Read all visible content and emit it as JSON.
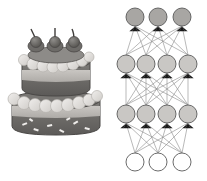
{
  "image": {
    "width": 207,
    "height": 181,
    "background": "#ffffff",
    "composition": "two-panel side-by-side illustration",
    "left_panel_name": "layered-birthday-cake",
    "right_panel_name": "feedforward-neural-network-diagram"
  },
  "cake": {
    "name": "two-tier layered cake",
    "style": "grayscale clip-art illustration",
    "tiers": 2,
    "topper_count": 3,
    "topper_name": "cherry-with-stem",
    "bounds": {
      "x": 12,
      "y": 32,
      "width": 88,
      "height": 103
    },
    "colors": {
      "frosting_light": "#e8e6e3",
      "frosting_mid": "#cfccc8",
      "cream_band": "#b9b6b2",
      "cake_dark": "#6f6d6a",
      "cake_mid": "#908d8a",
      "cake_shadow": "#585654",
      "outline": "#4a4846",
      "cherry_dark": "#5e5c5a",
      "cherry_mid": "#7e7c79",
      "stem": "#4a4846",
      "sprinkle": "#f2f0ee"
    },
    "top_tier": {
      "center_x": 56,
      "top_y": 52,
      "radius_x": 34,
      "height": 36,
      "bands": [
        "frosting-scallop",
        "dark-cake",
        "cream-stripe",
        "dark-cake"
      ]
    },
    "bottom_tier": {
      "center_x": 56,
      "top_y": 88,
      "radius_x": 44,
      "height": 47,
      "bands": [
        "frosting-scallop",
        "dark-cake",
        "cream-stripe",
        "dark-cake-with-sprinkles"
      ]
    },
    "toppers": [
      {
        "cx": 36,
        "cy": 44,
        "r": 7,
        "stem_tip_x": 31,
        "stem_tip_y": 30
      },
      {
        "cx": 55,
        "cy": 44,
        "r": 7,
        "stem_tip_x": 55,
        "stem_tip_y": 28
      },
      {
        "cx": 74,
        "cy": 44,
        "r": 7,
        "stem_tip_x": 72,
        "stem_tip_y": 30
      }
    ]
  },
  "network": {
    "name": "feedforward neural network",
    "layer_count": 4,
    "layer_sizes": [
      3,
      4,
      4,
      3
    ],
    "edge_color": "#8a8a8a",
    "node_outline": "#5a5a5a",
    "arrowheads": true,
    "arrow_color": "#1a1a1a",
    "flow_direction": "bottom-to-top",
    "layers": [
      {
        "index": 0,
        "role": "output-layer",
        "node_count": 3,
        "y": 17,
        "radius": 9,
        "fill": "#a8a6a3",
        "xs": [
          135,
          158,
          182
        ],
        "has_incoming_arrows": true
      },
      {
        "index": 1,
        "role": "hidden-layer-2",
        "node_count": 4,
        "y": 64,
        "radius": 9,
        "fill": "#c9c7c4",
        "xs": [
          126,
          146,
          167,
          188
        ],
        "has_incoming_arrows": true
      },
      {
        "index": 2,
        "role": "hidden-layer-1",
        "node_count": 4,
        "y": 114,
        "radius": 9,
        "fill": "#c9c7c4",
        "xs": [
          126,
          146,
          167,
          188
        ],
        "has_incoming_arrows": true
      },
      {
        "index": 3,
        "role": "input-layer",
        "node_count": 3,
        "y": 162,
        "radius": 9,
        "fill": "#ffffff",
        "xs": [
          135,
          158,
          182
        ],
        "has_incoming_arrows": false
      }
    ],
    "connections": [
      {
        "from_layer": 3,
        "to_layer": 2,
        "fully_connected": true,
        "edge_count": 12
      },
      {
        "from_layer": 2,
        "to_layer": 1,
        "fully_connected": true,
        "edge_count": 16
      },
      {
        "from_layer": 1,
        "to_layer": 0,
        "fully_connected": true,
        "edge_count": 12
      }
    ]
  }
}
